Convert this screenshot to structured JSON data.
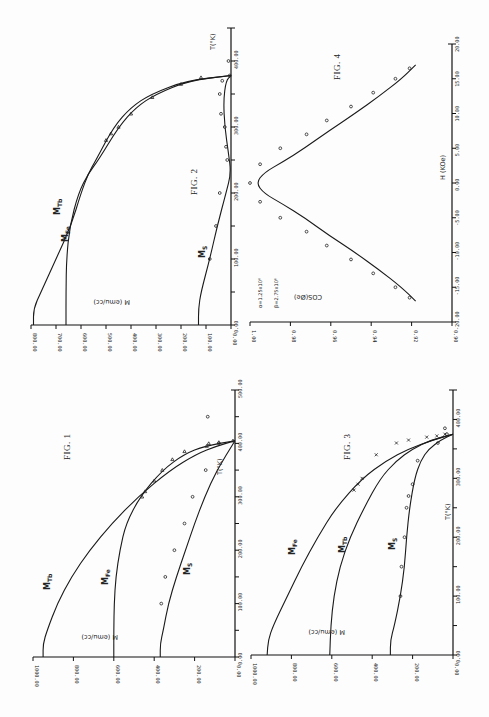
{
  "page": {
    "orientation": "rotated 90 degrees clockwise (landscape page scanned in portrait)",
    "figures_count": 4
  },
  "chart_data": [
    {
      "id": "fig1",
      "title": "FIG. 1",
      "type": "line",
      "xlabel": "T(°K)",
      "ylabel": "M (emu/cc)",
      "x_ticks": [
        "0.00",
        "100.00",
        "200.00",
        "300.00",
        "400.00",
        "500.00"
      ],
      "y_ticks": [
        "0.00",
        "200.00",
        "400.00",
        "600.00",
        "800.00",
        "1000.00"
      ],
      "xlim": [
        0,
        500
      ],
      "ylim": [
        0,
        1000
      ],
      "series": [
        {
          "name": "M_Tb",
          "label": "M",
          "sub": "Tb",
          "x": [
            0,
            25,
            50,
            100,
            150,
            200,
            250,
            300,
            350,
            380,
            395,
            405
          ],
          "values": [
            950,
            950,
            930,
            880,
            810,
            720,
            610,
            480,
            320,
            190,
            90,
            0
          ]
        },
        {
          "name": "M_Fe",
          "label": "M",
          "sub": "Fe",
          "x": [
            0,
            50,
            100,
            150,
            200,
            250,
            300,
            350,
            380,
            395,
            405
          ],
          "values": [
            600,
            600,
            598,
            590,
            570,
            540,
            470,
            360,
            250,
            150,
            0
          ]
        },
        {
          "name": "M_S",
          "label": "M",
          "sub": "S",
          "x": [
            0,
            25,
            50,
            100,
            150,
            200,
            250,
            300,
            350,
            405
          ],
          "values": [
            370,
            370,
            355,
            330,
            290,
            245,
            200,
            150,
            90,
            0
          ]
        }
      ],
      "markers": {
        "triangles": [
          [
            300,
            460
          ],
          [
            310,
            445
          ],
          [
            330,
            400
          ],
          [
            350,
            360
          ],
          [
            370,
            310
          ],
          [
            385,
            250
          ],
          [
            395,
            140
          ],
          [
            400,
            130
          ],
          [
            402,
            80
          ],
          [
            405,
            10
          ]
        ],
        "circles": [
          [
            100,
            365
          ],
          [
            150,
            345
          ],
          [
            200,
            300
          ],
          [
            250,
            250
          ],
          [
            300,
            210
          ],
          [
            350,
            145
          ],
          [
            400,
            80
          ],
          [
            450,
            135
          ]
        ]
      }
    },
    {
      "id": "fig2",
      "title": "FIG. 2",
      "type": "line",
      "xlabel": "T(°K)",
      "ylabel": "M (emu/cc)",
      "x_ticks": [
        "0.00",
        "100.00",
        "200.00",
        "300.00",
        "400.00"
      ],
      "y_ticks": [
        "0.00",
        "100.00",
        "200.00",
        "300.00",
        "400.00",
        "500.00",
        "600.00",
        "700.00",
        "800.00"
      ],
      "xlim": [
        0,
        450
      ],
      "ylim": [
        0,
        800
      ],
      "series": [
        {
          "name": "M_Tb",
          "label": "M",
          "sub": "Tb",
          "x": [
            0,
            25,
            50,
            100,
            150,
            200,
            230,
            250,
            300,
            330,
            350,
            370,
            378
          ],
          "values": [
            790,
            790,
            760,
            700,
            640,
            600,
            570,
            540,
            470,
            400,
            320,
            180,
            0
          ]
        },
        {
          "name": "M_Fe",
          "label": "M",
          "sub": "Fe",
          "x": [
            0,
            50,
            100,
            150,
            200,
            230,
            250,
            300,
            330,
            350,
            370,
            378
          ],
          "values": [
            660,
            660,
            658,
            645,
            610,
            570,
            530,
            450,
            380,
            300,
            170,
            0
          ]
        },
        {
          "name": "M_S",
          "label": "M",
          "sub": "S",
          "x": [
            0,
            25,
            50,
            100,
            150,
            200,
            230,
            260,
            300,
            340,
            370,
            378
          ],
          "values": [
            130,
            130,
            120,
            85,
            55,
            20,
            0,
            10,
            25,
            30,
            20,
            0
          ]
        }
      ],
      "markers": {
        "triangles": [
          [
            280,
            500
          ],
          [
            290,
            480
          ],
          [
            300,
            450
          ],
          [
            320,
            400
          ],
          [
            345,
            315
          ],
          [
            365,
            200
          ],
          [
            375,
            120
          ]
        ],
        "circles": [
          [
            100,
            85
          ],
          [
            150,
            60
          ],
          [
            200,
            45
          ],
          [
            250,
            15
          ],
          [
            270,
            20
          ],
          [
            300,
            25
          ],
          [
            320,
            40
          ],
          [
            350,
            45
          ],
          [
            370,
            35
          ],
          [
            378,
            5
          ],
          [
            400,
            10
          ]
        ]
      }
    },
    {
      "id": "fig3",
      "title": "FIG. 3",
      "type": "line",
      "xlabel": "T(°K)",
      "ylabel": "M (emu/cc)",
      "x_ticks": [
        "0.00",
        "100.00",
        "200.00",
        "300.00",
        "400.00"
      ],
      "y_ticks": [
        "0.00",
        "200.00",
        "400.00",
        "600.00",
        "800.00",
        "1000.00"
      ],
      "xlim": [
        0,
        450
      ],
      "ylim": [
        0,
        1000
      ],
      "series": [
        {
          "name": "M_Fe",
          "label": "M",
          "sub": "Fe",
          "x": [
            0,
            25,
            50,
            100,
            150,
            200,
            250,
            300,
            330,
            350,
            365,
            375
          ],
          "values": [
            920,
            915,
            890,
            820,
            750,
            670,
            580,
            450,
            330,
            220,
            100,
            0
          ]
        },
        {
          "name": "M_Tb",
          "label": "M",
          "sub": "Tb",
          "x": [
            0,
            50,
            100,
            150,
            200,
            250,
            300,
            330,
            350,
            365,
            375
          ],
          "values": [
            610,
            605,
            590,
            560,
            510,
            440,
            360,
            280,
            200,
            110,
            0
          ]
        },
        {
          "name": "M_S",
          "label": "M",
          "sub": "S",
          "x": [
            0,
            25,
            50,
            100,
            150,
            200,
            250,
            300,
            330,
            350,
            365,
            375
          ],
          "values": [
            310,
            310,
            290,
            260,
            240,
            230,
            215,
            190,
            160,
            120,
            60,
            0
          ]
        }
      ],
      "markers": {
        "crosses": [
          [
            280,
            490
          ],
          [
            290,
            470
          ],
          [
            300,
            450
          ],
          [
            340,
            380
          ],
          [
            360,
            280
          ],
          [
            365,
            220
          ],
          [
            370,
            130
          ],
          [
            372,
            80
          ],
          [
            375,
            40
          ]
        ],
        "circles": [
          [
            100,
            260
          ],
          [
            150,
            255
          ],
          [
            200,
            240
          ],
          [
            250,
            230
          ],
          [
            270,
            220
          ],
          [
            290,
            200
          ],
          [
            330,
            175
          ],
          [
            360,
            75
          ],
          [
            375,
            30
          ],
          [
            385,
            40
          ]
        ]
      }
    },
    {
      "id": "fig4",
      "title": "FIG. 4",
      "type": "line",
      "xlabel": "H (KOe)",
      "ylabel": "COS(Øe)",
      "x_ticks": [
        "-20.00",
        "-15.00",
        "-10.00",
        "-5.00",
        "0.00",
        "5.00",
        "10.00",
        "15.00",
        "20.00"
      ],
      "y_ticks": [
        "0.90",
        "0.92",
        "0.94",
        "0.96",
        "0.98",
        "1.00"
      ],
      "xlim": [
        -20,
        20
      ],
      "ylim": [
        0.9,
        1.0
      ],
      "annotations": [
        "α=1.25x10⁶",
        "β=2.75x10⁶"
      ],
      "series": [
        {
          "name": "fit",
          "x": [
            -17,
            -15,
            -12.5,
            -10,
            -7.5,
            -5,
            -3,
            -1.5,
            0,
            1.5,
            3,
            5,
            7.5,
            10,
            12.5,
            15,
            17
          ],
          "values": [
            0.918,
            0.925,
            0.936,
            0.948,
            0.961,
            0.973,
            0.984,
            0.993,
            0.997,
            0.993,
            0.984,
            0.973,
            0.961,
            0.948,
            0.936,
            0.925,
            0.918
          ]
        }
      ],
      "markers": {
        "circles": [
          [
            -16.5,
            0.921
          ],
          [
            -15,
            0.928
          ],
          [
            -13,
            0.939
          ],
          [
            -11,
            0.95
          ],
          [
            -9,
            0.962
          ],
          [
            -7,
            0.972
          ],
          [
            -5,
            0.985
          ],
          [
            -2.7,
            0.995
          ],
          [
            0,
            1.0
          ],
          [
            2.7,
            0.995
          ],
          [
            5,
            0.985
          ],
          [
            7,
            0.972
          ],
          [
            9,
            0.962
          ],
          [
            11,
            0.95
          ],
          [
            13,
            0.939
          ],
          [
            15,
            0.928
          ],
          [
            16.5,
            0.921
          ]
        ]
      }
    }
  ]
}
